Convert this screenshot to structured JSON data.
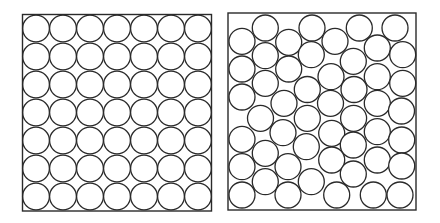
{
  "figure": {
    "stroke_color": "#2a2a2a",
    "background": "#ffffff",
    "panels": [
      {
        "name": "ordered-square-packing",
        "box": {
          "x": 22.5,
          "y": 14.5,
          "w": 189,
          "h": 196.5
        },
        "grid": {
          "cols": 7,
          "rows": 7,
          "r": 13.4,
          "x0": 36.0,
          "y0": 28.5,
          "dx": 27.0,
          "dy": 28.0
        }
      },
      {
        "name": "random-disordered-packing",
        "box": {
          "x": 228,
          "y": 13,
          "w": 188,
          "h": 197
        },
        "r": 13.0,
        "circles": [
          [
            265.3,
            28
          ],
          [
            312,
            28
          ],
          [
            359.3,
            28
          ],
          [
            395,
            28
          ],
          [
            242,
            41.3
          ],
          [
            288.7,
            42.3
          ],
          [
            335,
            41.3
          ],
          [
            377.3,
            48
          ],
          [
            402.7,
            54.7
          ],
          [
            265.3,
            55.7
          ],
          [
            311.3,
            54.7
          ],
          [
            353.3,
            61.3
          ],
          [
            242,
            69
          ],
          [
            288.7,
            69
          ],
          [
            331,
            76.7
          ],
          [
            377.3,
            76.7
          ],
          [
            402.7,
            83.3
          ],
          [
            265.3,
            83.3
          ],
          [
            307.3,
            89.5
          ],
          [
            354,
            89.5
          ],
          [
            242,
            97
          ],
          [
            284,
            103.3
          ],
          [
            330.5,
            103.3
          ],
          [
            377.3,
            103.3
          ],
          [
            401.5,
            111
          ],
          [
            260.5,
            118.3
          ],
          [
            307.3,
            118.3
          ],
          [
            353.6,
            118.3
          ],
          [
            242,
            139.3
          ],
          [
            283,
            132.7
          ],
          [
            331.7,
            133.3
          ],
          [
            377.3,
            131.7
          ],
          [
            401.7,
            140
          ],
          [
            265.3,
            153.3
          ],
          [
            306.3,
            146.7
          ],
          [
            353.3,
            145
          ],
          [
            242,
            166.7
          ],
          [
            288,
            166.7
          ],
          [
            331.7,
            160
          ],
          [
            377.3,
            160
          ],
          [
            401.7,
            166
          ],
          [
            265.3,
            181.7
          ],
          [
            311.3,
            181.7
          ],
          [
            353.3,
            174
          ],
          [
            242,
            195
          ],
          [
            288,
            195
          ],
          [
            336.7,
            195
          ],
          [
            373.3,
            195
          ],
          [
            400,
            195
          ]
        ]
      }
    ]
  }
}
